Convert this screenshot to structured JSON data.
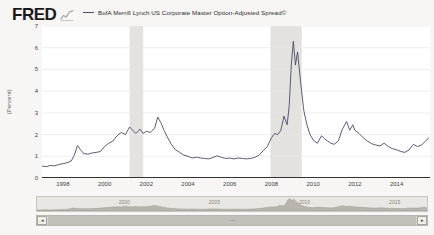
{
  "header": {
    "logo_text": "FRED",
    "logo_glyph_icon": "mini-chart-icon",
    "legend_label": "BofA Merrill Lynch US Corporate Master Option-Adjusted Spread©",
    "legend_color": "#4a4a6a"
  },
  "nav": {
    "left_arrow": "◂",
    "right_arrow": "▸",
    "grip": "⋯",
    "ticks": [
      {
        "label": "2000",
        "x": 0.225
      },
      {
        "label": "2005",
        "x": 0.455
      },
      {
        "label": "2010",
        "x": 0.685
      },
      {
        "label": "2015",
        "x": 0.915
      }
    ]
  },
  "chart_data": {
    "type": "line",
    "title": "BofA Merrill Lynch US Corporate Master Option-Adjusted Spread©",
    "xlabel": "",
    "ylabel": "(Percent)",
    "ylim": [
      0,
      7
    ],
    "yticks": [
      0,
      1,
      2,
      3,
      4,
      5,
      6,
      7
    ],
    "xlim": [
      1997.0,
      2015.6
    ],
    "xticks": [
      "1998",
      "2000",
      "2002",
      "2004",
      "2006",
      "2008",
      "2010",
      "2012",
      "2014"
    ],
    "xtick_values": [
      1998,
      2000,
      2002,
      2004,
      2006,
      2008,
      2010,
      2012,
      2014
    ],
    "grid": true,
    "legend_position": "top",
    "line_color": "#4a4a6a",
    "recession_color": "#e4e2de",
    "recessions": [
      {
        "start": 2001.2,
        "end": 2001.85
      },
      {
        "start": 2007.95,
        "end": 2009.45
      }
    ],
    "series": [
      {
        "name": "BofA Merrill Lynch US Corporate Master Option-Adjusted Spread©",
        "x": [
          1997.0,
          1997.2,
          1997.4,
          1997.6,
          1997.8,
          1998.0,
          1998.2,
          1998.4,
          1998.55,
          1998.7,
          1998.85,
          1999.0,
          1999.2,
          1999.4,
          1999.6,
          1999.8,
          2000.0,
          2000.2,
          2000.4,
          2000.6,
          2000.8,
          2001.0,
          2001.2,
          2001.35,
          2001.5,
          2001.7,
          2001.85,
          2002.0,
          2002.2,
          2002.4,
          2002.55,
          2002.7,
          2002.85,
          2003.0,
          2003.2,
          2003.4,
          2003.6,
          2003.8,
          2004.0,
          2004.2,
          2004.4,
          2004.6,
          2004.8,
          2005.0,
          2005.2,
          2005.4,
          2005.6,
          2005.8,
          2006.0,
          2006.2,
          2006.4,
          2006.6,
          2006.8,
          2007.0,
          2007.2,
          2007.4,
          2007.6,
          2007.8,
          2008.0,
          2008.15,
          2008.3,
          2008.45,
          2008.6,
          2008.75,
          2008.85,
          2008.95,
          2009.05,
          2009.15,
          2009.25,
          2009.4,
          2009.55,
          2009.7,
          2009.85,
          2010.0,
          2010.2,
          2010.4,
          2010.55,
          2010.7,
          2010.85,
          2011.0,
          2011.2,
          2011.4,
          2011.6,
          2011.75,
          2011.9,
          2012.0,
          2012.2,
          2012.4,
          2012.6,
          2012.8,
          2013.0,
          2013.2,
          2013.4,
          2013.6,
          2013.8,
          2014.0,
          2014.2,
          2014.4,
          2014.6,
          2014.8,
          2015.0,
          2015.2,
          2015.4,
          2015.55
        ],
        "y": [
          0.55,
          0.52,
          0.58,
          0.56,
          0.62,
          0.66,
          0.7,
          0.78,
          1.05,
          1.5,
          1.3,
          1.12,
          1.1,
          1.15,
          1.18,
          1.22,
          1.45,
          1.6,
          1.7,
          1.95,
          2.1,
          2.0,
          2.35,
          2.2,
          2.05,
          2.25,
          2.05,
          2.15,
          2.1,
          2.3,
          2.8,
          2.55,
          2.2,
          1.9,
          1.55,
          1.3,
          1.18,
          1.05,
          1.0,
          0.92,
          0.96,
          0.92,
          0.9,
          0.88,
          0.95,
          1.02,
          0.95,
          0.9,
          0.92,
          0.88,
          0.92,
          0.9,
          0.88,
          0.9,
          0.95,
          1.05,
          1.25,
          1.45,
          1.85,
          2.05,
          2.0,
          2.2,
          2.85,
          2.45,
          3.3,
          5.2,
          6.3,
          5.2,
          5.8,
          4.4,
          3.1,
          2.45,
          2.0,
          1.75,
          1.6,
          1.95,
          1.8,
          1.7,
          1.6,
          1.55,
          1.7,
          2.25,
          2.6,
          2.2,
          2.45,
          2.2,
          2.05,
          1.85,
          1.7,
          1.58,
          1.52,
          1.48,
          1.6,
          1.45,
          1.35,
          1.3,
          1.22,
          1.18,
          1.3,
          1.55,
          1.45,
          1.52,
          1.72,
          1.85
        ]
      }
    ]
  }
}
